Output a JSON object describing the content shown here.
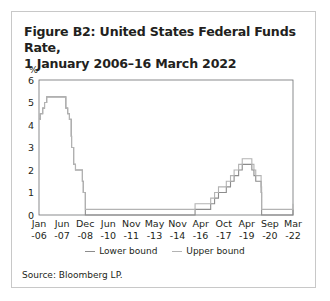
{
  "title": {
    "line1": "Figure B2: United States Federal Funds Rate,",
    "line2": "1 January 2006–16 March 2022"
  },
  "legend": {
    "lower_label": "Lower bound",
    "upper_label": "Upper bound",
    "lower_color": "#8c8c8c",
    "upper_color": "#b3b3b3"
  },
  "source": "Source: Bloomberg LP.",
  "chart_data": {
    "type": "line",
    "title": "Figure B2: United States Federal Funds Rate, 1 January 2006–16 March 2022",
    "xlabel": "",
    "ylabel": "%",
    "ylim": [
      0,
      6
    ],
    "yticks": [
      0,
      1,
      2,
      3,
      4,
      5,
      6
    ],
    "xticks": [
      "Jan -06",
      "Jun -07",
      "Dec -08",
      "Jun -10",
      "Nov -11",
      "May -13",
      "Nov -14",
      "Apr -16",
      "Oct -17",
      "Apr -19",
      "Sep -20",
      "Mar -22"
    ],
    "grid": false,
    "legend_position": "bottom",
    "step": true,
    "series": [
      {
        "name": "Lower bound",
        "x": [
          "2006-01-01",
          "2006-01-31",
          "2006-03-28",
          "2006-05-10",
          "2006-06-29",
          "2007-09-18",
          "2007-10-31",
          "2007-12-11",
          "2008-01-22",
          "2008-01-30",
          "2008-03-18",
          "2008-04-30",
          "2008-10-08",
          "2008-10-29",
          "2008-12-16",
          "2015-12-16",
          "2016-12-14",
          "2017-03-15",
          "2017-06-14",
          "2017-12-13",
          "2018-03-21",
          "2018-06-13",
          "2018-09-26",
          "2018-12-19",
          "2019-07-31",
          "2019-09-18",
          "2019-10-30",
          "2020-03-03",
          "2020-03-15",
          "2022-03-16"
        ],
        "values": [
          4.25,
          4.5,
          4.75,
          5.0,
          5.25,
          4.75,
          4.5,
          4.25,
          3.5,
          3.0,
          2.25,
          2.0,
          1.5,
          1.0,
          0.0,
          0.25,
          0.5,
          0.75,
          1.0,
          1.25,
          1.5,
          1.75,
          2.0,
          2.25,
          2.0,
          1.75,
          1.5,
          1.0,
          0.0,
          0.25
        ]
      },
      {
        "name": "Upper bound",
        "x": [
          "2006-01-01",
          "2006-01-31",
          "2006-03-28",
          "2006-05-10",
          "2006-06-29",
          "2007-09-18",
          "2007-10-31",
          "2007-12-11",
          "2008-01-22",
          "2008-01-30",
          "2008-03-18",
          "2008-04-30",
          "2008-10-08",
          "2008-10-29",
          "2008-12-16",
          "2015-12-16",
          "2016-12-14",
          "2017-03-15",
          "2017-06-14",
          "2017-12-13",
          "2018-03-21",
          "2018-06-13",
          "2018-09-26",
          "2018-12-19",
          "2019-07-31",
          "2019-09-18",
          "2019-10-30",
          "2020-03-03",
          "2020-03-15",
          "2022-03-16"
        ],
        "values": [
          4.25,
          4.5,
          4.75,
          5.0,
          5.25,
          4.75,
          4.5,
          4.25,
          3.5,
          3.0,
          2.25,
          2.0,
          1.5,
          1.0,
          0.25,
          0.5,
          0.75,
          1.0,
          1.25,
          1.5,
          1.75,
          2.0,
          2.25,
          2.5,
          2.25,
          2.0,
          1.75,
          1.25,
          0.25,
          0.5
        ]
      }
    ]
  }
}
